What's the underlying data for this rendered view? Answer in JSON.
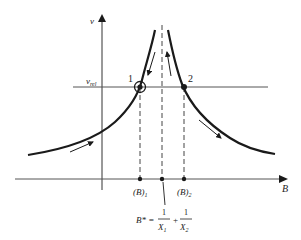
{
  "diagram": {
    "axes": {
      "y_label": "v",
      "x_label": "B"
    },
    "reference_line": {
      "label_main": "v",
      "label_sub": "rel"
    },
    "points": [
      {
        "id": "1",
        "label": "1",
        "style": "circled"
      },
      {
        "id": "2",
        "label": "2",
        "style": "filled"
      }
    ],
    "x_markers": [
      {
        "label_main": "(B)",
        "label_sub": "1"
      },
      {
        "label_main": "(B)",
        "label_sub": "2"
      }
    ],
    "equation": {
      "lhs": "B* =",
      "frac1_num": "1",
      "frac1_den_main": "X",
      "frac1_den_sub": "1",
      "plus": "+",
      "frac2_num": "1",
      "frac2_den_main": "X",
      "frac2_den_sub": "2"
    },
    "colors": {
      "line": "#1a1a1a",
      "background": "#ffffff"
    }
  }
}
